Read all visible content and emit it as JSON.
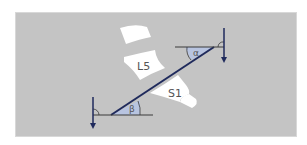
{
  "diagram": {
    "labels": {
      "upper_vertebra": "L5",
      "lower_vertebra": "S1",
      "angle_top": "α",
      "angle_bottom": "β"
    },
    "colors": {
      "background": "#c4c4c4",
      "bone": "#ffffff",
      "line": "#1f2a5c",
      "angle_fill": "#b8c4e0",
      "arrow": "#1f2a5c",
      "reference_line": "#3a3a3a"
    }
  }
}
